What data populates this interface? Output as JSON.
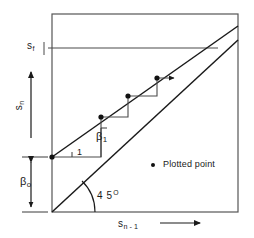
{
  "figure": {
    "width": 254,
    "height": 238,
    "background_color": "#ffffff",
    "line_color": "#1a1a1a",
    "frame_color": "#555555"
  },
  "axes": {
    "x_label": "s",
    "x_label_sub": "n - 1",
    "y_label": "s",
    "y_label_sub": "n",
    "x_arrow": "right-arrow",
    "y_arrow": "up-arrow",
    "frame": {
      "left": 52,
      "right": 238,
      "top": 14,
      "bottom": 212
    }
  },
  "annotations": {
    "fixed_point_label": "s",
    "fixed_point_sub": "f",
    "intercept_label": "β",
    "intercept_sub": "o",
    "slope_label": "β",
    "slope_sub": "1",
    "run_label": "1",
    "angle_label": "4 5",
    "angle_sup": "O"
  },
  "legend": {
    "marker": "plotted-point-dot",
    "label": "Plotted  point"
  },
  "chart_data": {
    "type": "line",
    "xlabel": "s_(n-1)",
    "ylabel": "s_n",
    "xlim": [
      0,
      1
    ],
    "ylim": [
      0,
      1
    ],
    "grid": false,
    "legend_position": "inside-right",
    "series": [
      {
        "name": "45-degree identity line  s_n = s_(n-1)",
        "type": "line",
        "points": [
          [
            52,
            212
          ],
          [
            238,
            40
          ]
        ]
      },
      {
        "name": "recursion line  s_n = beta_o + beta_1 * s_(n-1)",
        "type": "line",
        "points": [
          [
            52,
            157
          ],
          [
            238,
            26
          ]
        ]
      },
      {
        "name": "fixed-point level line  s_f",
        "type": "line",
        "points": [
          [
            48,
            48
          ],
          [
            218,
            48
          ]
        ]
      },
      {
        "name": "cobweb staircase path",
        "type": "line",
        "points": [
          [
            52,
            157
          ],
          [
            101,
            157
          ],
          [
            101,
            117
          ],
          [
            128,
            117
          ],
          [
            128,
            96
          ],
          [
            157,
            96
          ],
          [
            157,
            78
          ],
          [
            175,
            78
          ]
        ]
      }
    ],
    "plotted_points": [
      [
        52,
        157
      ],
      [
        101,
        117
      ],
      [
        128,
        96
      ],
      [
        157,
        78
      ]
    ],
    "slope_triangle": {
      "run_from": [
        72,
        157
      ],
      "run_to": [
        101,
        157
      ],
      "rise_from": [
        101,
        157
      ],
      "rise_to": [
        101,
        128
      ]
    },
    "beta_o_bracket": {
      "from": [
        31,
        157
      ],
      "to": [
        31,
        212
      ]
    },
    "angle_arc_degrees": 45
  }
}
